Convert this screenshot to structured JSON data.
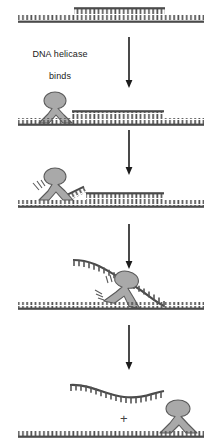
{
  "figure": {
    "title_text": "DNA helicase binds",
    "caption_line_1": "DNA helicase",
    "caption_line_2": "binds",
    "plus_symbol": "+",
    "colors": {
      "dna_stroke": "#4a4a4a",
      "dna_teeth": "#555555",
      "helicase_fill": "#a9a9a9",
      "helicase_stroke": "#5a5a5a",
      "arrow": "#1c1c1c",
      "text": "#1a1a1a",
      "background": "#ffffff"
    },
    "panels": [
      {
        "id": "panel-1-duplex",
        "label": "double-stranded DNA with annealed short strand",
        "template_strand": "long bottom strand spanning full width, teeth up",
        "short_strand": "short top strand, teeth down, annealed over center-right",
        "helicase_present": "no"
      },
      {
        "id": "panel-2-helicase-binds",
        "label": "DNA helicase binds at left edge of duplex",
        "template_strand": "long bottom strand spanning full width, teeth up",
        "short_strand": "short top strand annealed right of helicase",
        "helicase_present": "yes",
        "helicase_position": "left"
      },
      {
        "id": "panel-3-unwinding-begins",
        "label": "helicase begins unwinding, lifting strand end",
        "template_strand": "long bottom strand spanning full width, teeth up",
        "short_strand": "short strand with peeled-up left end",
        "helicase_present": "yes",
        "helicase_position": "left",
        "motion_lines": "yes"
      },
      {
        "id": "panel-4-unwinding-midway",
        "label": "helicase midway, displaced strand arcs overhead",
        "template_strand": "long bottom strand spanning full width, teeth up",
        "short_strand": "displaced strand arcing over helicase",
        "helicase_present": "yes",
        "helicase_position": "center",
        "motion_lines": "yes"
      },
      {
        "id": "panel-5-separated",
        "label": "released single strand plus template with helicase",
        "template_strand": "long bottom strand spanning full width, teeth up",
        "short_strand": "free wavy single strand above",
        "helicase_present": "yes",
        "helicase_position": "right",
        "plus_between_products": "+"
      }
    ],
    "arrows": [
      {
        "id": "arrow-1",
        "direction": "down"
      },
      {
        "id": "arrow-2",
        "direction": "down"
      },
      {
        "id": "arrow-3",
        "direction": "down"
      },
      {
        "id": "arrow-4",
        "direction": "down"
      }
    ]
  }
}
